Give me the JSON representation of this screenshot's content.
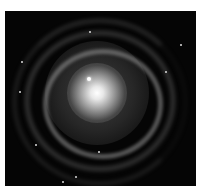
{
  "image": {
    "subject": "spiral galaxy",
    "style": "grayscale astronomical photograph",
    "background": "#ffffff",
    "frame_color": "#050505"
  }
}
